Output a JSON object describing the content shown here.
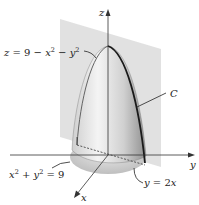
{
  "figure": {
    "axes": {
      "x_label": "x",
      "y_label": "y",
      "z_label": "z"
    },
    "labels": {
      "surface": {
        "lhs": "z",
        "eq": " = 9 − ",
        "x": "x",
        "minus": " − ",
        "y": "y",
        "exp": "2"
      },
      "curve": "C",
      "circle": {
        "x": "x",
        "plus": " + ",
        "y": "y",
        "eq": " = 9",
        "exp": "2"
      },
      "plane": {
        "y": "y",
        "eq": " = 2",
        "x": "x"
      }
    },
    "colors": {
      "plane_fill": "#d9d9d9",
      "surface_light": "#f2f2f2",
      "surface_dark": "#9a9a9a",
      "curve": "#1a1a1a",
      "axis": "#333333"
    }
  }
}
